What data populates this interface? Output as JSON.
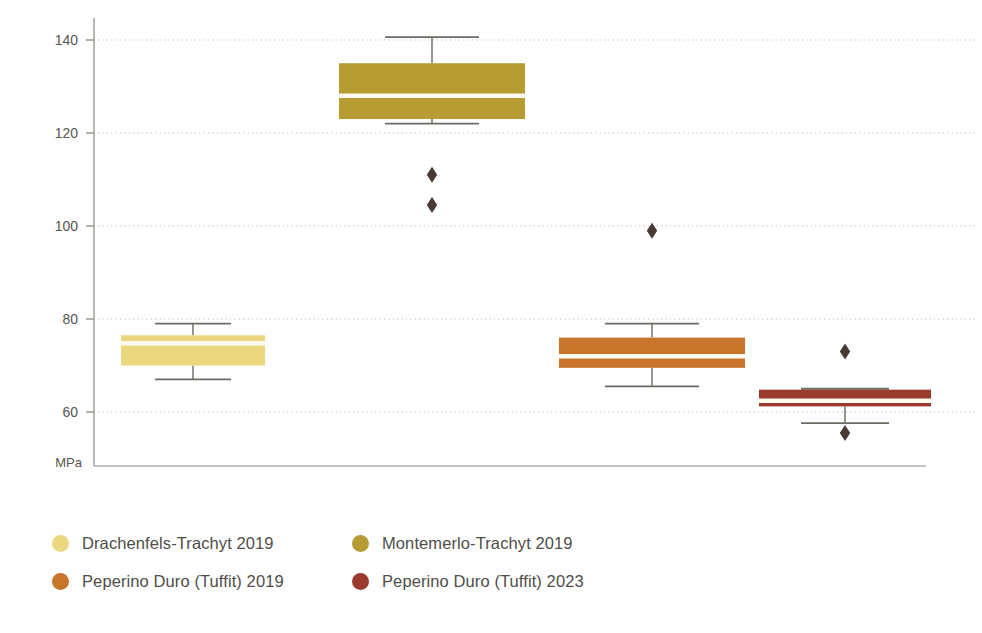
{
  "chart_data": {
    "type": "box",
    "title": "",
    "xlabel": "",
    "ylabel": "MPa",
    "unit_label": "MPa",
    "ylim": [
      52,
      145
    ],
    "yticks": [
      60,
      80,
      100,
      120,
      140
    ],
    "ytick_labels": [
      "60",
      "80",
      "100",
      "120",
      "140"
    ],
    "grid": "horizontal-dotted",
    "legend_position": "bottom-left",
    "categories": [
      "Drachenfels-Trachyt 2019",
      "Montemerlo-Trachyt 2019",
      "Peperino Duro (Tuffit) 2019",
      "Peperino Duro (Tuffit) 2023"
    ],
    "series": [
      {
        "name": "Drachenfels-Trachyt 2019",
        "color": "#EBD77E",
        "whisker_low": 67.0,
        "q1": 70.0,
        "median": 74.8,
        "q3": 76.5,
        "whisker_high": 79.0,
        "outliers": []
      },
      {
        "name": "Montemerlo-Trachyt 2019",
        "color": "#B79B33",
        "whisker_low": 122.0,
        "q1": 123.0,
        "median": 128.0,
        "q3": 135.0,
        "whisker_high": 140.6,
        "outliers": [
          111.0,
          104.5
        ]
      },
      {
        "name": "Peperino Duro (Tuffit) 2019",
        "color": "#C8742A",
        "whisker_low": 65.5,
        "q1": 69.5,
        "median": 72.0,
        "q3": 76.0,
        "whisker_high": 79.0,
        "outliers": [
          99.0
        ]
      },
      {
        "name": "Peperino Duro (Tuffit) 2023",
        "color": "#9B3B30",
        "whisker_low": 57.6,
        "q1": 61.2,
        "median": 62.4,
        "q3": 64.8,
        "whisker_high": 65.0,
        "outliers": [
          73.0,
          55.5
        ]
      }
    ],
    "outlier_marker": {
      "shape": "diamond",
      "color": "#463A33"
    }
  },
  "legend": {
    "items": [
      {
        "label": "Drachenfels-Trachyt 2019",
        "color": "#EBD77E"
      },
      {
        "label": "Montemerlo-Trachyt 2019",
        "color": "#B79B33"
      },
      {
        "label": "Peperino Duro (Tuffit) 2019",
        "color": "#C8742A"
      },
      {
        "label": "Peperino Duro (Tuffit) 2023",
        "color": "#9B3B30"
      }
    ]
  },
  "axis": {
    "unit": "MPa",
    "tick_140": "140",
    "tick_120": "120",
    "tick_100": "100",
    "tick_80": "80",
    "tick_60": "60"
  }
}
